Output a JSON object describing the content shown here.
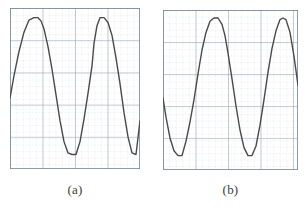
{
  "figure": {
    "background_color": "#ffffff",
    "panels": [
      {
        "id": "a",
        "caption": "(a)",
        "grid": {
          "minor_color": "#c3cdd8",
          "major_color": "#7f8b98",
          "border_color": "#7f8b98",
          "minor_step_px": 6.5,
          "major_every": 5,
          "minor_style": "dotted",
          "major_style": "solid"
        },
        "trace": {
          "color": "#4a4a4a",
          "width_px": 1.4
        }
      },
      {
        "id": "b",
        "caption": "(b)",
        "grid": {
          "minor_color": "#c3cdd8",
          "major_color": "#7f8b98",
          "border_color": "#7f8b98",
          "minor_step_px": 6.5,
          "major_every": 5,
          "minor_style": "dotted",
          "major_style": "solid"
        },
        "trace": {
          "color": "#4a4a4a",
          "width_px": 1.4
        }
      }
    ]
  },
  "chart_data": [
    {
      "type": "line",
      "id": "a",
      "title": "(a)",
      "xlabel": "",
      "ylabel": "",
      "grid": true,
      "legend": "none",
      "axis_labels_shown": false,
      "waveform": "clipped sine",
      "description": "Flat-topped (clipped) sinusoid, two full positive peaks visible, starting partway up the rising edge at the left border.",
      "amplitude_clip_top": 0.88,
      "amplitude_clip_bottom": -0.82,
      "period_px": 52,
      "phase_start_value": -0.12,
      "xlim": [
        0,
        130
      ],
      "ylim": [
        -1,
        1
      ],
      "x": [
        0,
        4,
        9,
        14,
        19,
        24,
        28,
        31,
        34,
        38,
        42,
        46,
        50,
        54,
        58,
        62,
        66,
        70,
        74,
        78,
        82,
        84,
        87,
        90,
        94,
        98,
        102,
        106,
        110,
        114,
        118,
        122,
        126,
        130
      ],
      "y": [
        -0.12,
        0.16,
        0.46,
        0.7,
        0.85,
        0.88,
        0.88,
        0.84,
        0.74,
        0.52,
        0.24,
        -0.08,
        -0.4,
        -0.66,
        -0.8,
        -0.82,
        -0.82,
        -0.66,
        -0.38,
        -0.06,
        0.28,
        0.56,
        0.78,
        0.88,
        0.88,
        0.82,
        0.66,
        0.38,
        0.06,
        -0.3,
        -0.6,
        -0.8,
        -0.82,
        -0.4
      ]
    },
    {
      "type": "line",
      "id": "b",
      "title": "(b)",
      "xlabel": "",
      "ylabel": "",
      "grid": true,
      "legend": "none",
      "axis_labels_shown": false,
      "waveform": "clipped sine",
      "description": "Flat-topped (clipped) sinusoid of the same amplitude and period as (a), but phase-shifted so the trace begins on a falling edge at the left border.",
      "amplitude_clip_top": 0.9,
      "amplitude_clip_bottom": -0.82,
      "period_px": 58,
      "phase_start_value": -0.1,
      "xlim": [
        0,
        135
      ],
      "ylim": [
        -1,
        1
      ],
      "x": [
        0,
        3,
        7,
        11,
        15,
        19,
        23,
        27,
        31,
        35,
        39,
        43,
        47,
        51,
        55,
        59,
        62,
        65,
        69,
        73,
        77,
        81,
        85,
        89,
        93,
        97,
        101,
        105,
        109,
        113,
        117,
        120,
        123,
        127,
        131,
        135
      ],
      "y": [
        -0.1,
        -0.34,
        -0.6,
        -0.76,
        -0.82,
        -0.82,
        -0.64,
        -0.4,
        -0.12,
        0.2,
        0.5,
        0.72,
        0.86,
        0.9,
        0.9,
        0.82,
        0.68,
        0.46,
        0.14,
        -0.2,
        -0.5,
        -0.72,
        -0.82,
        -0.82,
        -0.7,
        -0.44,
        -0.12,
        0.22,
        0.52,
        0.74,
        0.88,
        0.9,
        0.88,
        0.72,
        0.42,
        0.06
      ]
    }
  ]
}
